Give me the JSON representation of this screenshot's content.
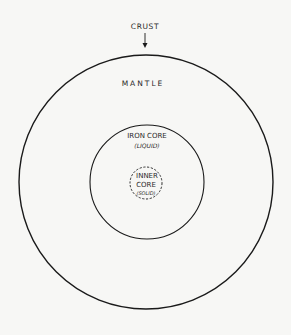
{
  "diagram": {
    "labels": {
      "crust": "CRUST",
      "mantle": "MANTLE",
      "iron_core": "IRON CORE",
      "iron_core_state": "(LIQUID)",
      "inner_core_line1": "INNER",
      "inner_core_line2": "CORE",
      "inner_core_state": "(SOLID)"
    },
    "layers": [
      {
        "name": "Crust / Mantle outer boundary",
        "style": "solid"
      },
      {
        "name": "Iron core (liquid)",
        "style": "solid"
      },
      {
        "name": "Inner core (solid)",
        "style": "dashed"
      }
    ],
    "colors": {
      "line": "#1a1a1a",
      "background": "#f7f7f5"
    }
  }
}
